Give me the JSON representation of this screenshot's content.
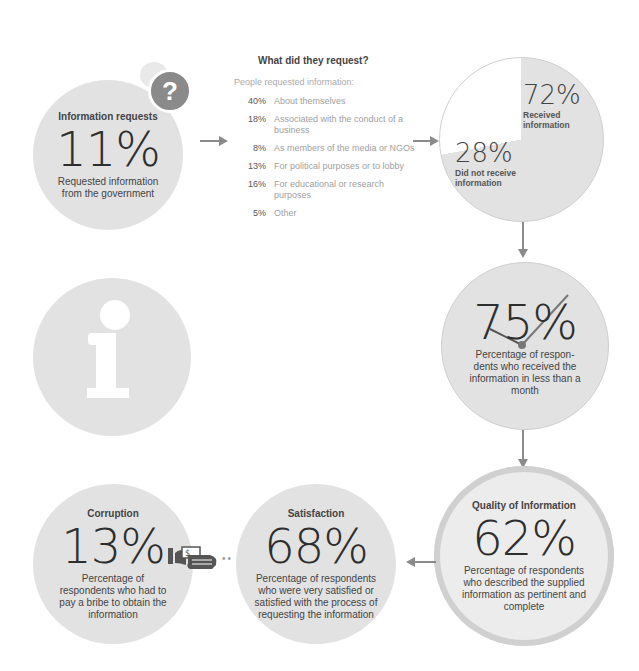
{
  "info_requests": {
    "title": "Information requests",
    "value": "11%",
    "description": "Requested information from the government",
    "icon": "question-bubble-icon"
  },
  "requests_breakdown": {
    "title": "What did they request?",
    "intro": "People requested information:",
    "items": [
      {
        "pct": "40%",
        "label": "About themselves"
      },
      {
        "pct": "18%",
        "label": "Associated with the conduct of a business"
      },
      {
        "pct": "8%",
        "label": "As members of the media or NGOs"
      },
      {
        "pct": "13%",
        "label": "For political purposes or to lobby"
      },
      {
        "pct": "16%",
        "label": "For educational or research purposes"
      },
      {
        "pct": "5%",
        "label": "Other"
      }
    ]
  },
  "received": {
    "received_value": "72%",
    "received_label": "Received information",
    "not_received_value": "28%",
    "not_received_label": "Did not receive information"
  },
  "timeliness": {
    "value": "75%",
    "description": "Percentage of respon-dents who received the information in less than a month",
    "icon": "clock-hands-icon"
  },
  "info_icon": "info-icon",
  "quality": {
    "title": "Quality of Information",
    "value": "62%",
    "description": "Percentage of respondents who described the supplied information as pertinent and complete"
  },
  "satisfaction": {
    "title": "Satisfaction",
    "value": "68%",
    "description": "Percentage of respondents who were very satisfied or satisfied with the process of requesting the information"
  },
  "corruption": {
    "title": "Corruption",
    "value": "13%",
    "description": "Percentage of respondents who had to pay a bribe to obtain the information",
    "icon": "bribe-money-hand-icon"
  },
  "colors": {
    "circle_fill": "#e2e2e2",
    "arrow": "#8a8a8a",
    "text_dark": "#3a3a3a",
    "text_muted": "#a0a0a0"
  }
}
